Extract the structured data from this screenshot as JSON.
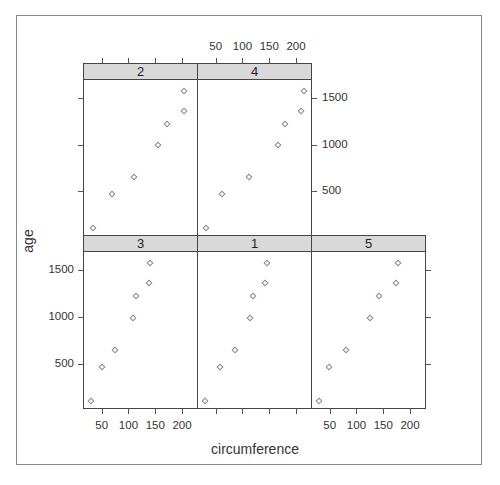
{
  "chart_data": {
    "type": "scatter",
    "layout": "lattice xyplot, 3 columns x 2 rows, conditioned by Tree",
    "xlabel": "circumference",
    "ylabel": "age",
    "xlim": [
      17,
      228
    ],
    "ylim": [
      32,
      1702
    ],
    "x_ticks": [
      50,
      100,
      150,
      200
    ],
    "y_ticks": [
      500,
      1000,
      1500
    ],
    "grid": false,
    "legend": null,
    "panels": [
      {
        "label": "3",
        "row": "bottom",
        "col": 0,
        "x": [
          30,
          51,
          75,
          108,
          115,
          139,
          140
        ],
        "y": [
          118,
          484,
          664,
          1004,
          1231,
          1372,
          1582
        ]
      },
      {
        "label": "1",
        "row": "bottom",
        "col": 1,
        "x": [
          30,
          58,
          87,
          115,
          120,
          142,
          145
        ],
        "y": [
          118,
          484,
          664,
          1004,
          1231,
          1372,
          1582
        ]
      },
      {
        "label": "5",
        "row": "bottom",
        "col": 2,
        "x": [
          30,
          49,
          81,
          125,
          142,
          174,
          177
        ],
        "y": [
          118,
          484,
          664,
          1004,
          1231,
          1372,
          1582
        ]
      },
      {
        "label": "2",
        "row": "top",
        "col": 0,
        "x": [
          33,
          69,
          111,
          156,
          172,
          203,
          203
        ],
        "y": [
          118,
          484,
          664,
          1004,
          1231,
          1372,
          1582
        ]
      },
      {
        "label": "4",
        "row": "top",
        "col": 1,
        "x": [
          32,
          62,
          112,
          167,
          179,
          209,
          214
        ],
        "y": [
          118,
          484,
          664,
          1004,
          1231,
          1372,
          1582
        ]
      }
    ]
  },
  "labels": {
    "xlabel": "circumference",
    "ylabel": "age",
    "x_tick_labels": [
      "50",
      "100",
      "150",
      "200"
    ],
    "y_tick_labels": [
      "500",
      "1000",
      "1500"
    ]
  }
}
